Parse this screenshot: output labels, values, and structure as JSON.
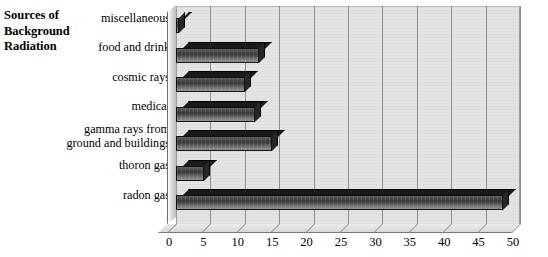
{
  "title": {
    "line1": "Sources of",
    "line2": "Background",
    "line3": "Radiation"
  },
  "chart_data": {
    "type": "bar",
    "orientation": "horizontal",
    "title": "Sources of Background Radiation",
    "xlabel": "",
    "ylabel": "",
    "xlim": [
      0,
      50
    ],
    "xticks": [
      0,
      5,
      10,
      15,
      20,
      25,
      30,
      35,
      40,
      45,
      50
    ],
    "xtick_labels": [
      "0",
      "5",
      "10",
      "15",
      "20",
      "25",
      "30",
      "35",
      "40",
      "45",
      "50"
    ],
    "grid": true,
    "grid_axis": "x",
    "legend": false,
    "style": "3d-grayscale",
    "categories": [
      "miscellaneous",
      "food and drink",
      "cosmic rays",
      "medical",
      "gamma rays from\nground and buildings",
      "thoron gas",
      "radon gas"
    ],
    "values": [
      0.5,
      12,
      10,
      11.5,
      14,
      4,
      47.5
    ],
    "series": [
      {
        "name": "percentage",
        "values": [
          0.5,
          12,
          10,
          11.5,
          14,
          4,
          47.5
        ]
      }
    ],
    "colors": {
      "bar_front": "#3a3a3a",
      "bar_top": "#1a1a1a",
      "bar_side": "#262626",
      "plot_background": "#e3e3e3",
      "gridline": "#8d8d8d",
      "text": "#000000"
    }
  }
}
